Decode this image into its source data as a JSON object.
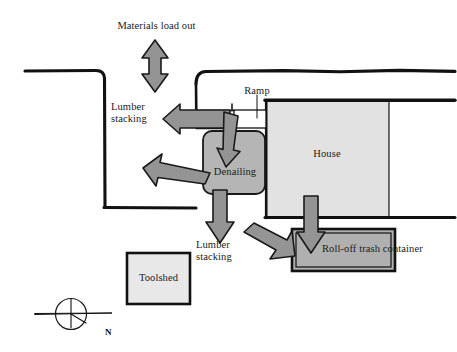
{
  "diagram": {
    "type": "site-plan",
    "width": 457,
    "height": 352,
    "background": "#ffffff"
  },
  "colors": {
    "outline": "#111111",
    "arrow_fill": "#949494",
    "arrow_stroke": "#1a1a1a",
    "zone_fill_dark": "#b5b5b5",
    "zone_fill_light": "#e2e2e2",
    "container_fill": "#b0b0b0",
    "text": "#1a1a1a"
  },
  "labels": {
    "materials_load_out": "Materials load out",
    "lumber_stacking_left_line1": "Lumber",
    "lumber_stacking_left_line2": "stacking",
    "lumber_stacking_bottom_line1": "Lumber",
    "lumber_stacking_bottom_line2": "stacking",
    "ramp": "Ramp",
    "denailing": "Denailing",
    "house": "House",
    "roll_off_trash_container": "Roll-off trash container",
    "toolshed": "Toolshed",
    "north": "N"
  },
  "zones": [
    {
      "id": "lumber-stacking-yard",
      "label": "Lumber stacking",
      "shape": "open-rectangle",
      "fill": "none",
      "stroke": "#111111"
    },
    {
      "id": "denailing-station",
      "label": "Denailing",
      "shape": "rounded-rectangle",
      "fill": "#b5b5b5",
      "stroke": "#1a1a1a"
    },
    {
      "id": "house",
      "label": "House",
      "shape": "rectangle",
      "fill": "#e2e2e2",
      "stroke": "#111111"
    },
    {
      "id": "roll-off-trash-container",
      "label": "Roll-off trash container",
      "shape": "double-border-rectangle",
      "fill": "#b0b0b0",
      "stroke": "#111111"
    },
    {
      "id": "toolshed",
      "label": "Toolshed",
      "shape": "rectangle",
      "fill": "#e8e8e8",
      "stroke": "#111111"
    },
    {
      "id": "ramp",
      "label": "Ramp",
      "shape": "small-rectangle",
      "fill": "none",
      "stroke": "#111111"
    }
  ],
  "flow_arrows": [
    {
      "id": "materials-load-out-arrow",
      "direction": "double-vertical",
      "from": "site",
      "to": "street",
      "label": "Materials load out"
    },
    {
      "id": "house-to-lumber-stacking-left-arrow",
      "direction": "left",
      "from": "house",
      "to": "lumber stacking"
    },
    {
      "id": "ramp-to-denailing-arrow",
      "direction": "down",
      "from": "ramp",
      "to": "denailing"
    },
    {
      "id": "denailing-to-lumber-stacking-diagonal-arrow",
      "direction": "upper-left",
      "from": "denailing",
      "to": "lumber stacking"
    },
    {
      "id": "denailing-to-lumber-stacking-down-arrow",
      "direction": "down",
      "from": "denailing",
      "to": "lumber stacking"
    },
    {
      "id": "denailing-to-trash-container-diagonal-arrow",
      "direction": "lower-right",
      "from": "denailing",
      "to": "roll-off trash container"
    },
    {
      "id": "house-to-trash-container-arrow",
      "direction": "down",
      "from": "house",
      "to": "roll-off trash container"
    }
  ],
  "compass": {
    "label": "N",
    "type": "north-arrow-rose"
  }
}
